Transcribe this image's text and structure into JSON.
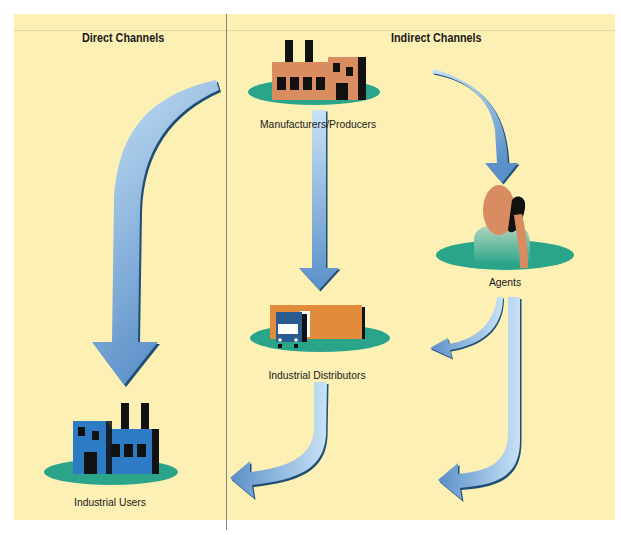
{
  "diagram": {
    "sections": [
      {
        "heading": "Direct Channels"
      },
      {
        "heading": "Indirect Channels"
      }
    ],
    "nodes": [
      {
        "id": "manufacturers",
        "label": "Manufacturers/Producers",
        "icon": "factory-icon",
        "color": "#d98c60"
      },
      {
        "id": "agents",
        "label": "Agents",
        "icon": "person-phone-icon",
        "color": "#d98c60"
      },
      {
        "id": "distributors",
        "label": "Industrial Distributors",
        "icon": "warehouse-truck-icon",
        "color": "#e38b3c"
      },
      {
        "id": "users",
        "label": "Industrial Users",
        "icon": "factory-icon",
        "color": "#2d7bc4"
      }
    ],
    "edges": [
      {
        "from": "manufacturers",
        "to": "users",
        "channel": "direct"
      },
      {
        "from": "manufacturers",
        "to": "distributors",
        "channel": "indirect"
      },
      {
        "from": "manufacturers",
        "to": "agents",
        "channel": "indirect"
      },
      {
        "from": "agents",
        "to": "distributors",
        "channel": "indirect"
      },
      {
        "from": "distributors",
        "to": "users",
        "channel": "indirect"
      },
      {
        "from": "agents",
        "to": "users",
        "channel": "indirect"
      }
    ],
    "colors": {
      "background": "#fcf0b4",
      "platform": "#2aa58a",
      "arrow_light": "#c4def4",
      "arrow_dark": "#5a8fc8",
      "arrow_shadow": "#1f4f75"
    }
  }
}
